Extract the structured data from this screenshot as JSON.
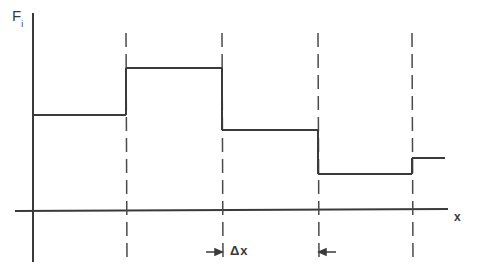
{
  "figure": {
    "y_axis_label": "F",
    "y_axis_subscript": "i",
    "x_axis_label": "x",
    "interval_label": "Δx",
    "line_color": "#3a3a3a",
    "background": "#ffffff"
  },
  "geometry": {
    "y_axis": {
      "x": 33,
      "y1": 13,
      "y2": 262
    },
    "x_axis": {
      "y": 211,
      "x1": 15,
      "x2": 448
    },
    "dashed_verticals_x": [
      126,
      222,
      318,
      412
    ],
    "dashed_extent": {
      "y1": 33,
      "y2": 262
    },
    "steps": [
      {
        "x1": 33,
        "x2": 126,
        "y": 115
      },
      {
        "x1": 126,
        "x2": 222,
        "y": 68
      },
      {
        "x1": 222,
        "x2": 318,
        "y": 130
      },
      {
        "x1": 318,
        "x2": 412,
        "y": 174
      },
      {
        "x1": 412,
        "x2": 445,
        "y": 158
      }
    ],
    "interval_arrows": {
      "y": 252,
      "left_x": 222,
      "right_x": 318
    }
  }
}
